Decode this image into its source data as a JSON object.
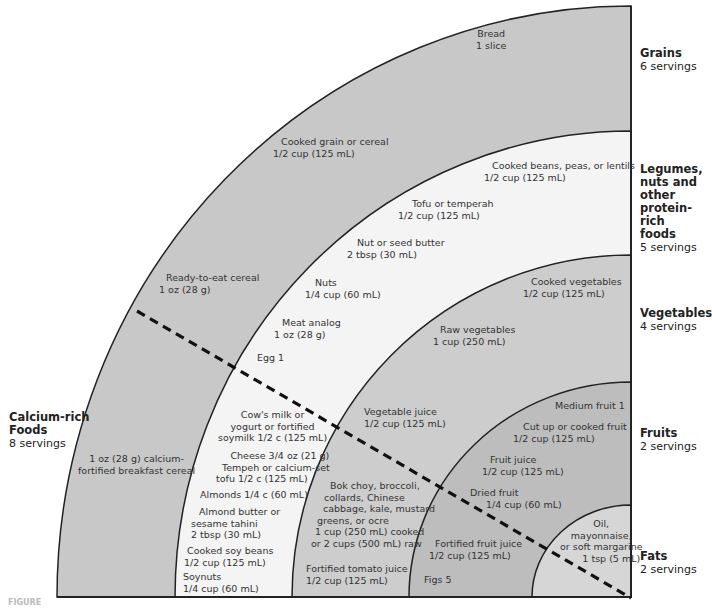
{
  "diagram": {
    "type": "quarter-circle food guide",
    "colors": {
      "grains": "#c8c8c8",
      "legumes": "#f4f4f4",
      "vegetables": "#cdcdcd",
      "fruits": "#bdbdbd",
      "fats": "#d6d6d6",
      "outline": "#222222",
      "divider": "#111111"
    },
    "categories": [
      {
        "name": "Grains",
        "servings": "6 servings"
      },
      {
        "name": "Legumes, nuts and other protein-rich foods",
        "name_lines": [
          "Legumes,",
          "nuts and",
          "other",
          "protein-rich",
          "foods"
        ],
        "servings": "5 servings"
      },
      {
        "name": "Vegetables",
        "servings": "4 servings"
      },
      {
        "name": "Fruits",
        "servings": "2 servings"
      },
      {
        "name": "Fats",
        "servings": "2 servings"
      },
      {
        "name": "Calcium-rich Foods",
        "name_lines": [
          "Calcium-rich",
          "Foods"
        ],
        "servings": "8 servings"
      }
    ],
    "grains_items": [
      {
        "line1": "Bread",
        "line2": "1 slice"
      },
      {
        "line1": "Cooked grain or cereal",
        "line2": "1/2 cup (125 mL)"
      },
      {
        "line1": "Ready-to-eat cereal",
        "line2": "1 oz (28 g)"
      },
      {
        "line1": "1 oz (28 g) calcium-",
        "line2": "fortified breakfast cereal"
      }
    ],
    "legumes_items": [
      {
        "line1": "Cooked beans, peas, or lentils",
        "line2": "1/2 cup (125 mL)"
      },
      {
        "line1": "Tofu or temperah",
        "line2": "1/2 cup (125 mL)"
      },
      {
        "line1": "Nut or seed butter",
        "line2": "2 tbsp (30 mL)"
      },
      {
        "line1": "Nuts",
        "line2": "1/4 cup (60 mL)"
      },
      {
        "line1": "Meat analog",
        "line2": "1 oz (28 g)"
      },
      {
        "line1": "Egg 1"
      }
    ],
    "legumes_calcium_items": [
      {
        "lines": [
          "Cow's milk or",
          "yogurt or fortified",
          "soymilk 1/2 c (125 mL)"
        ]
      },
      {
        "lines": [
          "Cheese 3/4 oz (21 g)"
        ]
      },
      {
        "lines": [
          "Tempeh or calcium-set",
          "tofu 1/2 c (125 mL)"
        ]
      },
      {
        "lines": [
          "Almonds 1/4 c (60 mL)"
        ]
      },
      {
        "lines": [
          "Almond butter or",
          "sesame tahini",
          "2 tbsp (30 mL)"
        ]
      },
      {
        "lines": [
          "Cooked soy beans",
          "1/2 cup (125 mL)"
        ]
      },
      {
        "lines": [
          "Soynuts",
          "1/4 cup (60 mL)"
        ]
      }
    ],
    "vegetables_items": [
      {
        "line1": "Cooked vegetables",
        "line2": "1/2 cup (125 mL)"
      },
      {
        "line1": "Raw vegetables",
        "line2": "1 cup (250 mL)"
      },
      {
        "line1": "Vegetable juice",
        "line2": "1/2 cup (125 mL)"
      },
      {
        "lines": [
          "Bok choy, broccoli,",
          "collards, Chinese",
          "cabbage, kale, mustard",
          "greens, or ocre",
          "1 cup (250 mL) cooked",
          "or 2 cups (500 mL) raw"
        ]
      },
      {
        "line1": "Fortified tomato juice",
        "line2": "1/2 cup (125 mL)"
      }
    ],
    "fruits_items": [
      {
        "line1": "Medium fruit 1"
      },
      {
        "line1": "Cut up or cooked fruit",
        "line2": "1/2 cup (125 mL)"
      },
      {
        "line1": "Fruit juice",
        "line2": "1/2 cup (125 mL)"
      },
      {
        "line1": "Dried fruit",
        "line2": "1/4 cup (60 mL)"
      },
      {
        "line1": "Fortified fruit juice",
        "line2": "1/2 cup (125 mL)"
      },
      {
        "line1": "Figs 5"
      }
    ],
    "fats_items": [
      {
        "lines": [
          "Oil,",
          "mayonnaise,",
          "or soft margarine",
          "1 tsp (5 mL)"
        ]
      }
    ],
    "caption": "FIGURE"
  }
}
